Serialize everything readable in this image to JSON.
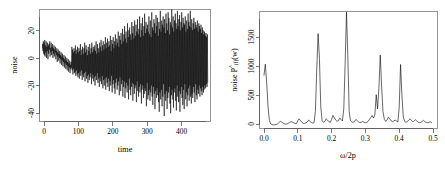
{
  "figure": {
    "panel_count": 2,
    "background_color": "#ffffff",
    "line_color": "#000000",
    "axis_color": "#555555",
    "box_color": "#888888"
  },
  "left_panel": {
    "name": "time-series-plot",
    "xlabel": "time",
    "ylabel": "noise",
    "x_ticks": [
      "0",
      "100",
      "200",
      "300",
      "400"
    ],
    "y_ticks": [
      "20",
      "0",
      "-20",
      "-40"
    ]
  },
  "right_panel": {
    "name": "periodogram-plot",
    "xlabel_parts": {
      "omega": "ω",
      "rest": "/2p"
    },
    "ylabel_parts": {
      "prefix": "noise ",
      "p": "P",
      "hat": "^",
      "sub": "(f)",
      "arg": "(w)"
    },
    "x_ticks": [
      "0.0",
      "0.1",
      "0.2",
      "0.3",
      "0.4",
      "0.5"
    ],
    "y_ticks": [
      "0",
      "500",
      "1000",
      "1500"
    ]
  },
  "chart_data": [
    {
      "type": "line",
      "name": "noise-time-series",
      "title": "",
      "xlabel": "time",
      "ylabel": "noise",
      "xlim": [
        -8,
        488
      ],
      "ylim": [
        -45,
        36
      ],
      "x_ticks": [
        0,
        100,
        200,
        300,
        400
      ],
      "y_ticks": [
        20,
        0,
        -20,
        -40
      ],
      "grid": false,
      "legend": false,
      "n_points": 480,
      "description": "Heteroscedastic zero-mean noise series whose amplitude grows with time; early values span roughly -12 to 14, late values span roughly -42 to 34.",
      "values": [
        8,
        11,
        6,
        13,
        4,
        12,
        3,
        14,
        2,
        10,
        5,
        13,
        1,
        9,
        6,
        12,
        0,
        10,
        4,
        11,
        7,
        13,
        2,
        8,
        5,
        12,
        3,
        9,
        6,
        11,
        1,
        8,
        4,
        10,
        2,
        7,
        5,
        9,
        0,
        6,
        3,
        8,
        -2,
        5,
        2,
        7,
        -1,
        4,
        1,
        6,
        -3,
        3,
        0,
        5,
        -4,
        2,
        -1,
        4,
        -5,
        1,
        -2,
        3,
        -6,
        0,
        -3,
        2,
        -7,
        -1,
        -4,
        1,
        -8,
        -2,
        -5,
        0,
        -9,
        -3,
        -6,
        -1,
        -10,
        -4,
        -7,
        -2,
        -6,
        9,
        -8,
        7,
        -11,
        5,
        -7,
        8,
        -10,
        6,
        -9,
        10,
        -12,
        4,
        -8,
        7,
        -11,
        9,
        -13,
        5,
        -10,
        8,
        -14,
        6,
        -9,
        11,
        -12,
        3,
        -8,
        7,
        -15,
        9,
        -11,
        4,
        -13,
        8,
        -10,
        12,
        -16,
        5,
        -9,
        10,
        -14,
        7,
        -12,
        3,
        -17,
        9,
        -11,
        6,
        -15,
        11,
        -13,
        4,
        -10,
        8,
        -18,
        12,
        -14,
        5,
        -11,
        9,
        -16,
        7,
        -13,
        10,
        -19,
        6,
        -12,
        13,
        -15,
        4,
        -10,
        11,
        -17,
        8,
        -14,
        5,
        -20,
        12,
        -13,
        9,
        -16,
        14,
        -18,
        6,
        -12,
        10,
        -21,
        13,
        -15,
        7,
        -19,
        11,
        -14,
        16,
        -22,
        8,
        -13,
        12,
        -17,
        15,
        -20,
        9,
        -14,
        13,
        -23,
        10,
        -16,
        17,
        -19,
        6,
        -12,
        14,
        -24,
        11,
        -18,
        16,
        -15,
        8,
        -21,
        13,
        -25,
        18,
        -17,
        10,
        -14,
        15,
        -22,
        12,
        -19,
        20,
        -16,
        9,
        -26,
        17,
        -13,
        14,
        -23,
        19,
        -18,
        11,
        -15,
        22,
        -27,
        13,
        -20,
        18,
        -16,
        24,
        -28,
        15,
        -21,
        20,
        -17,
        12,
        -24,
        26,
        -19,
        16,
        -29,
        21,
        -14,
        23,
        -22,
        18,
        -26,
        14,
        -20,
        27,
        -17,
        19,
        -30,
        24,
        -18,
        15,
        -25,
        28,
        -21,
        17,
        -19,
        25,
        -31,
        20,
        -16,
        29,
        -23,
        18,
        -27,
        22,
        -20,
        31,
        -24,
        16,
        -18,
        26,
        -32,
        21,
        -22,
        30,
        -19,
        17,
        -28,
        24,
        -25,
        33,
        -21,
        19,
        -23,
        27,
        -34,
        22,
        -17,
        25,
        -29,
        20,
        -26,
        31,
        -22,
        18,
        -30,
        28,
        -24,
        16,
        -19,
        34,
        -27,
        23,
        -33,
        21,
        -20,
        29,
        -25,
        26,
        -36,
        19,
        -23,
        32,
        -28,
        24,
        -21,
        30,
        -26,
        17,
        -31,
        27,
        -38,
        22,
        -24,
        35,
        -29,
        20,
        -22,
        28,
        -34,
        25,
        -27,
        31,
        -18,
        23,
        -41,
        29,
        -25,
        19,
        -30,
        33,
        -23,
        26,
        -36,
        21,
        -28,
        34,
        -24,
        30,
        -20,
        18,
        -32,
        27,
        -39,
        25,
        -26,
        36,
        -22,
        23,
        -29,
        31,
        -35,
        20,
        -24,
        28,
        -21,
        33,
        -30,
        26,
        -37,
        22,
        -19,
        35,
        -27,
        24,
        -31,
        29,
        -23,
        32,
        -38,
        21,
        -25,
        27,
        -20,
        34,
        -28,
        23,
        -33,
        30,
        -22,
        26,
        -36,
        25,
        -18,
        31,
        -29,
        20,
        -24,
        28,
        -34,
        22,
        -26,
        33,
        -21,
        27,
        -30,
        24,
        -19,
        35,
        -27,
        23,
        -32,
        29,
        -25,
        21,
        -28,
        26,
        -20,
        30,
        -24,
        22,
        -31,
        27,
        -18,
        25,
        -26,
        23,
        -29,
        28,
        -22,
        20,
        -25,
        26,
        -19,
        24,
        -27,
        22,
        -21,
        25,
        -23,
        19,
        -26,
        23,
        -20,
        21,
        -24,
        18,
        -22,
        20,
        -19,
        17,
        -21,
        19,
        -18,
        16,
        -20,
        18,
        -17
      ]
    },
    {
      "type": "line",
      "name": "smoothed-periodogram",
      "title": "",
      "xlabel": "ω/2p",
      "ylabel": "noise P̂(f)(w)",
      "xlim": [
        0.0,
        0.5
      ],
      "ylim": [
        0,
        1800
      ],
      "x_ticks": [
        0.0,
        0.1,
        0.2,
        0.3,
        0.4,
        0.5
      ],
      "y_ticks": [
        0,
        500,
        1000,
        1500
      ],
      "grid": false,
      "legend": false,
      "description": "Spectral estimate with five dominant narrow peaks at about 0.005, 0.165, 0.250, 0.348 and 0.412 cycles, plus a low noise floor near 60-160.",
      "peaks": [
        {
          "x": 0.005,
          "y": 990
        },
        {
          "x": 0.165,
          "y": 1460
        },
        {
          "x": 0.25,
          "y": 1790
        },
        {
          "x": 0.348,
          "y": 1130
        },
        {
          "x": 0.412,
          "y": 985
        }
      ],
      "x": [
        0.0,
        0.004,
        0.008,
        0.012,
        0.016,
        0.02,
        0.024,
        0.028,
        0.032,
        0.036,
        0.04,
        0.044,
        0.048,
        0.052,
        0.056,
        0.06,
        0.064,
        0.068,
        0.072,
        0.076,
        0.08,
        0.084,
        0.088,
        0.092,
        0.096,
        0.1,
        0.104,
        0.108,
        0.112,
        0.116,
        0.12,
        0.124,
        0.128,
        0.132,
        0.136,
        0.14,
        0.144,
        0.148,
        0.152,
        0.156,
        0.16,
        0.164,
        0.168,
        0.172,
        0.176,
        0.18,
        0.184,
        0.188,
        0.192,
        0.196,
        0.2,
        0.204,
        0.208,
        0.212,
        0.216,
        0.22,
        0.224,
        0.228,
        0.232,
        0.236,
        0.24,
        0.244,
        0.248,
        0.252,
        0.256,
        0.26,
        0.264,
        0.268,
        0.272,
        0.276,
        0.28,
        0.284,
        0.288,
        0.292,
        0.296,
        0.3,
        0.304,
        0.308,
        0.312,
        0.316,
        0.32,
        0.324,
        0.328,
        0.332,
        0.336,
        0.34,
        0.344,
        0.348,
        0.352,
        0.356,
        0.36,
        0.364,
        0.368,
        0.372,
        0.376,
        0.38,
        0.384,
        0.388,
        0.392,
        0.396,
        0.4,
        0.404,
        0.408,
        0.412,
        0.416,
        0.42,
        0.424,
        0.428,
        0.432,
        0.436,
        0.44,
        0.444,
        0.448,
        0.452,
        0.456,
        0.46,
        0.464,
        0.468,
        0.472,
        0.476,
        0.48,
        0.484,
        0.488,
        0.492,
        0.496,
        0.5
      ],
      "y": [
        820,
        990,
        700,
        330,
        120,
        70,
        60,
        55,
        58,
        62,
        70,
        90,
        110,
        100,
        85,
        72,
        66,
        70,
        80,
        95,
        105,
        98,
        88,
        78,
        74,
        120,
        150,
        120,
        95,
        80,
        78,
        86,
        100,
        130,
        110,
        92,
        84,
        90,
        260,
        900,
        1460,
        1080,
        330,
        120,
        95,
        110,
        150,
        130,
        105,
        92,
        140,
        200,
        165,
        130,
        110,
        120,
        160,
        140,
        115,
        300,
        980,
        1790,
        1120,
        260,
        120,
        100,
        95,
        110,
        140,
        120,
        100,
        92,
        96,
        110,
        95,
        88,
        92,
        110,
        140,
        170,
        200,
        160,
        210,
        520,
        300,
        620,
        1130,
        640,
        260,
        140,
        110,
        130,
        175,
        150,
        120,
        105,
        115,
        130,
        115,
        100,
        320,
        985,
        520,
        180,
        110,
        95,
        105,
        130,
        150,
        125,
        105,
        115,
        135,
        115,
        98,
        90,
        95,
        110,
        125,
        105,
        92,
        88,
        95,
        105,
        90
      ]
    }
  ]
}
